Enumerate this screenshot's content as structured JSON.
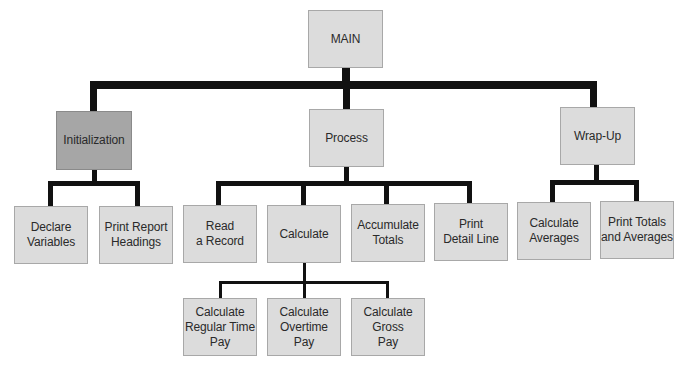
{
  "diagram": {
    "type": "hierarchy-chart",
    "root": {
      "id": "main",
      "label": "MAIN"
    },
    "level1": [
      {
        "id": "initialization",
        "label": "Initialization",
        "highlighted": true
      },
      {
        "id": "process",
        "label": "Process"
      },
      {
        "id": "wrap-up",
        "label": "Wrap-Up"
      }
    ],
    "initialization_children": [
      {
        "id": "declare-variables",
        "label": "Declare\nVariables"
      },
      {
        "id": "print-report-headings",
        "label": "Print Report\nHeadings"
      }
    ],
    "process_children": [
      {
        "id": "read-a-record",
        "label": "Read\na Record"
      },
      {
        "id": "calculate",
        "label": "Calculate"
      },
      {
        "id": "accumulate-totals",
        "label": "Accumulate\nTotals"
      },
      {
        "id": "print-detail-line",
        "label": "Print\nDetail Line"
      }
    ],
    "calculate_children": [
      {
        "id": "calc-regular-time-pay",
        "label": "Calculate\nRegular Time\nPay"
      },
      {
        "id": "calc-overtime-pay",
        "label": "Calculate\nOvertime\nPay"
      },
      {
        "id": "calc-gross-pay",
        "label": "Calculate\nGross\nPay"
      }
    ],
    "wrapup_children": [
      {
        "id": "calculate-averages",
        "label": "Calculate\nAverages"
      },
      {
        "id": "print-totals-and-averages",
        "label": "Print Totals\nand Averages"
      }
    ],
    "colors": {
      "box_fill": "#dcdcdc",
      "highlight_fill": "#a6a6a6",
      "connector": "#111111"
    }
  }
}
